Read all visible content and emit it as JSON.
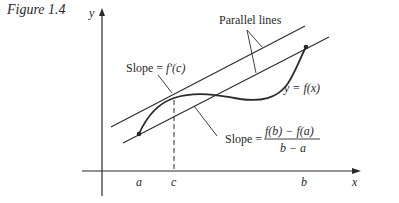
{
  "figure": {
    "caption": "Figure 1.4",
    "axes": {
      "x_label": "x",
      "y_label": "y"
    },
    "ticks": {
      "a": "a",
      "c": "c",
      "b": "b"
    },
    "labels": {
      "parallel_lines": "Parallel lines",
      "tangent_slope_prefix": "Slope = ",
      "tangent_slope_expr": "f′(c)",
      "curve": "y = f(x)",
      "secant_slope_prefix": "Slope = ",
      "secant_numerator": "f(b) − f(a)",
      "secant_denominator": "b − a"
    },
    "colors": {
      "ink": "#2a2a2a",
      "background": "#ffffff"
    }
  }
}
